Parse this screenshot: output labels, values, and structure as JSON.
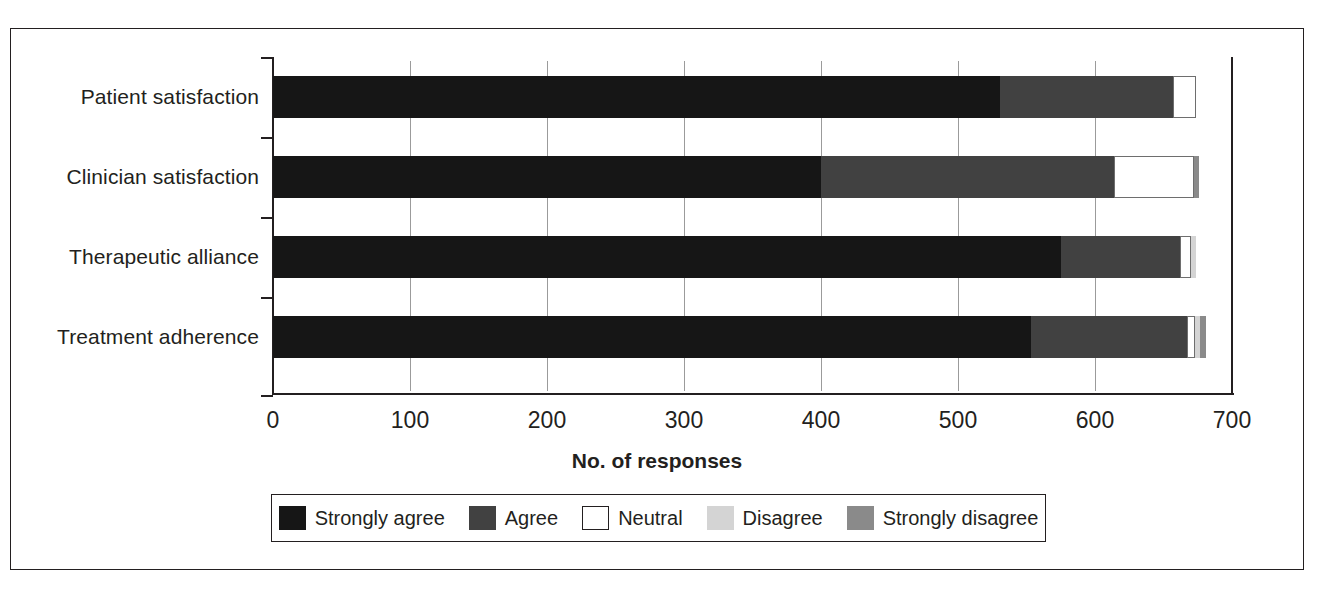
{
  "chart_data": {
    "type": "bar",
    "orientation": "horizontal",
    "stacked": true,
    "title": "",
    "xlabel": "No. of responses",
    "ylabel": "",
    "xlim": [
      0,
      700
    ],
    "xticks": [
      0,
      100,
      200,
      300,
      400,
      500,
      600,
      700
    ],
    "xtick_labels": [
      "0",
      "100",
      "200",
      "300",
      "400",
      "500",
      "600",
      "700"
    ],
    "grid": true,
    "legend_position": "bottom",
    "categories": [
      "Patient satisfaction",
      "Clinician satisfaction",
      "Therapeutic alliance",
      "Treatment adherence"
    ],
    "series": [
      {
        "name": "Strongly agree",
        "color": "#161616",
        "values": [
          531,
          400,
          575,
          553
        ]
      },
      {
        "name": "Agree",
        "color": "#414141",
        "values": [
          126,
          214,
          87,
          114
        ]
      },
      {
        "name": "Neutral",
        "color": "#ffffff",
        "values": [
          17,
          58,
          8,
          6
        ]
      },
      {
        "name": "Disagree",
        "color": "#d4d4d4",
        "values": [
          0,
          0,
          4,
          4
        ]
      },
      {
        "name": "Strongly disagree",
        "color": "#8a8a8a",
        "values": [
          0,
          4,
          0,
          4
        ]
      }
    ],
    "totals": [
      674,
      676,
      674,
      681
    ]
  },
  "legend": {
    "items": [
      {
        "label": "Strongly agree"
      },
      {
        "label": "Agree"
      },
      {
        "label": "Neutral"
      },
      {
        "label": "Disagree"
      },
      {
        "label": "Strongly disagree"
      }
    ]
  }
}
